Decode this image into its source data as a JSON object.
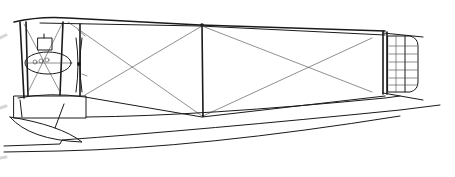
{
  "diagram": {
    "type": "technical-line-drawing",
    "view": "side",
    "width": 455,
    "height": 177,
    "colors": {
      "line": "#1a1a1a",
      "wire": "#444444",
      "background": "#ffffff",
      "fade_mark": "#bbbbbb"
    },
    "parts": [
      {
        "id": "upper-wing",
        "label": "upper wing"
      },
      {
        "id": "lower-wing",
        "label": "lower wing"
      },
      {
        "id": "engine-nacelle",
        "label": "engine nacelle"
      },
      {
        "id": "propeller",
        "label": "propeller"
      },
      {
        "id": "interplane-struts",
        "label": "interplane struts"
      },
      {
        "id": "bracing-wires",
        "label": "bracing wires"
      },
      {
        "id": "hull",
        "label": "hull"
      },
      {
        "id": "wingtip-float",
        "label": "wingtip float"
      },
      {
        "id": "tail-unit",
        "label": "tail unit"
      },
      {
        "id": "rudder",
        "label": "rudder"
      }
    ]
  }
}
